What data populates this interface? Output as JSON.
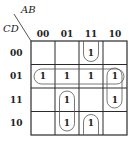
{
  "kmap": {
    "col_var": "AB",
    "row_var": "CD",
    "col_headers": [
      "00",
      "01",
      "11",
      "10"
    ],
    "row_headers": [
      "00",
      "01",
      "11",
      "10"
    ],
    "cells": [
      [
        "",
        "",
        "1",
        ""
      ],
      [
        "1",
        "1",
        "1",
        "1"
      ],
      [
        "",
        "1",
        "",
        "1"
      ],
      [
        "",
        "1",
        "1",
        ""
      ]
    ],
    "groups": [
      {
        "name": "row-01-quad",
        "cells": "CD=01, AB=00..10"
      },
      {
        "name": "col-11-wrap-pair",
        "cells": "AB=11, CD=00 and CD=10 (wrap)"
      },
      {
        "name": "col-10-pair",
        "cells": "AB=10, CD=01..11"
      },
      {
        "name": "col-01-pair",
        "cells": "AB=01, CD=11..10"
      }
    ],
    "colors": {
      "line": "#2b2b2b",
      "loop": "#555555",
      "text": "#222222"
    }
  }
}
